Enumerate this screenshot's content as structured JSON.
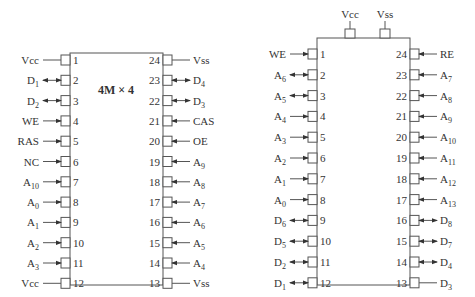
{
  "left_chip": {
    "title": "4M × 4",
    "left_pins": [
      {
        "num": "1",
        "label": "Vcc",
        "sub": "",
        "dir": "none"
      },
      {
        "num": "2",
        "label": "D",
        "sub": "1",
        "dir": "bi"
      },
      {
        "num": "3",
        "label": "D",
        "sub": "2",
        "dir": "bi"
      },
      {
        "num": "4",
        "label": "WE",
        "sub": "",
        "dir": "in"
      },
      {
        "num": "5",
        "label": "RAS",
        "sub": "",
        "dir": "in"
      },
      {
        "num": "6",
        "label": "NC",
        "sub": "",
        "dir": "in"
      },
      {
        "num": "7",
        "label": "A",
        "sub": "10",
        "dir": "in"
      },
      {
        "num": "8",
        "label": "A",
        "sub": "0",
        "dir": "in"
      },
      {
        "num": "9",
        "label": "A",
        "sub": "1",
        "dir": "in"
      },
      {
        "num": "10",
        "label": "A",
        "sub": "2",
        "dir": "in"
      },
      {
        "num": "11",
        "label": "A",
        "sub": "3",
        "dir": "in"
      },
      {
        "num": "12",
        "label": "Vcc",
        "sub": "",
        "dir": "none"
      }
    ],
    "right_pins": [
      {
        "num": "24",
        "label": "Vss",
        "sub": "",
        "dir": "none"
      },
      {
        "num": "23",
        "label": "D",
        "sub": "4",
        "dir": "bi"
      },
      {
        "num": "22",
        "label": "D",
        "sub": "3",
        "dir": "bi"
      },
      {
        "num": "21",
        "label": "CAS",
        "sub": "",
        "dir": "in"
      },
      {
        "num": "20",
        "label": "OE",
        "sub": "",
        "dir": "in"
      },
      {
        "num": "19",
        "label": "A",
        "sub": "9",
        "dir": "in"
      },
      {
        "num": "18",
        "label": "A",
        "sub": "8",
        "dir": "in"
      },
      {
        "num": "17",
        "label": "A",
        "sub": "7",
        "dir": "in"
      },
      {
        "num": "16",
        "label": "A",
        "sub": "6",
        "dir": "in"
      },
      {
        "num": "15",
        "label": "A",
        "sub": "5",
        "dir": "in"
      },
      {
        "num": "14",
        "label": "A",
        "sub": "4",
        "dir": "in"
      },
      {
        "num": "13",
        "label": "Vss",
        "sub": "",
        "dir": "none"
      }
    ]
  },
  "right_chip": {
    "top_pins": [
      {
        "label": "Vcc"
      },
      {
        "label": "Vss"
      }
    ],
    "left_pins": [
      {
        "num": "1",
        "label": "WE",
        "sub": "",
        "dir": "in"
      },
      {
        "num": "2",
        "label": "A",
        "sub": "6",
        "dir": "bi"
      },
      {
        "num": "3",
        "label": "A",
        "sub": "5",
        "dir": "bi"
      },
      {
        "num": "4",
        "label": "A",
        "sub": "4",
        "dir": "in"
      },
      {
        "num": "5",
        "label": "A",
        "sub": "3",
        "dir": "in"
      },
      {
        "num": "6",
        "label": "A",
        "sub": "2",
        "dir": "in"
      },
      {
        "num": "7",
        "label": "A",
        "sub": "1",
        "dir": "in"
      },
      {
        "num": "8",
        "label": "A",
        "sub": "0",
        "dir": "in"
      },
      {
        "num": "9",
        "label": "D",
        "sub": "6",
        "dir": "bi"
      },
      {
        "num": "10",
        "label": "D",
        "sub": "5",
        "dir": "bi"
      },
      {
        "num": "11",
        "label": "D",
        "sub": "2",
        "dir": "bi"
      },
      {
        "num": "12",
        "label": "D",
        "sub": "1",
        "dir": "bi"
      }
    ],
    "right_pins": [
      {
        "num": "24",
        "label": "RE",
        "sub": "",
        "dir": "in"
      },
      {
        "num": "23",
        "label": "A",
        "sub": "7",
        "dir": "in"
      },
      {
        "num": "22",
        "label": "A",
        "sub": "8",
        "dir": "in"
      },
      {
        "num": "21",
        "label": "A",
        "sub": "9",
        "dir": "in"
      },
      {
        "num": "20",
        "label": "A",
        "sub": "10",
        "dir": "in"
      },
      {
        "num": "19",
        "label": "A",
        "sub": "11",
        "dir": "in"
      },
      {
        "num": "18",
        "label": "A",
        "sub": "12",
        "dir": "in"
      },
      {
        "num": "17",
        "label": "A",
        "sub": "13",
        "dir": "in"
      },
      {
        "num": "16",
        "label": "D",
        "sub": "8",
        "dir": "bi"
      },
      {
        "num": "15",
        "label": "D",
        "sub": "7",
        "dir": "bi"
      },
      {
        "num": "14",
        "label": "D",
        "sub": "4",
        "dir": "bi"
      },
      {
        "num": "13",
        "label": "D",
        "sub": "3",
        "dir": "none"
      }
    ]
  },
  "colors": {
    "line": "#555555",
    "text": "#333333",
    "background": "#ffffff"
  }
}
